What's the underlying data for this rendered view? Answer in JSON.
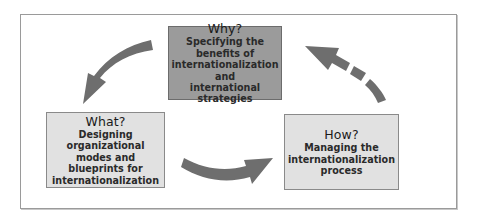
{
  "diagram": {
    "type": "cycle",
    "colors": {
      "frame_border": "#9a9a9a",
      "why_box_fill": "#9b9b9b",
      "what_how_box_fill": "#e1e1e1",
      "arrow": "#6e6e6e"
    },
    "nodes": [
      {
        "id": "why",
        "title": "Why?",
        "description_lines": [
          "Specifying the benefits of",
          "internationalization and",
          "international strategies"
        ]
      },
      {
        "id": "what",
        "title": "What?",
        "description_lines": [
          "Designing organizational",
          "modes and blueprints for",
          "internationalization"
        ]
      },
      {
        "id": "how",
        "title": "How?",
        "description_lines": [
          "Managing the",
          "internationalization",
          "process"
        ]
      }
    ],
    "edges": [
      {
        "from": "why",
        "to": "what",
        "style": "solid",
        "icon": "curved-arrow-down-left-icon"
      },
      {
        "from": "what",
        "to": "how",
        "style": "solid",
        "icon": "curved-arrow-right-icon"
      },
      {
        "from": "how",
        "to": "why",
        "style": "dashed",
        "icon": "dashed-curved-arrow-up-left-icon"
      }
    ]
  }
}
